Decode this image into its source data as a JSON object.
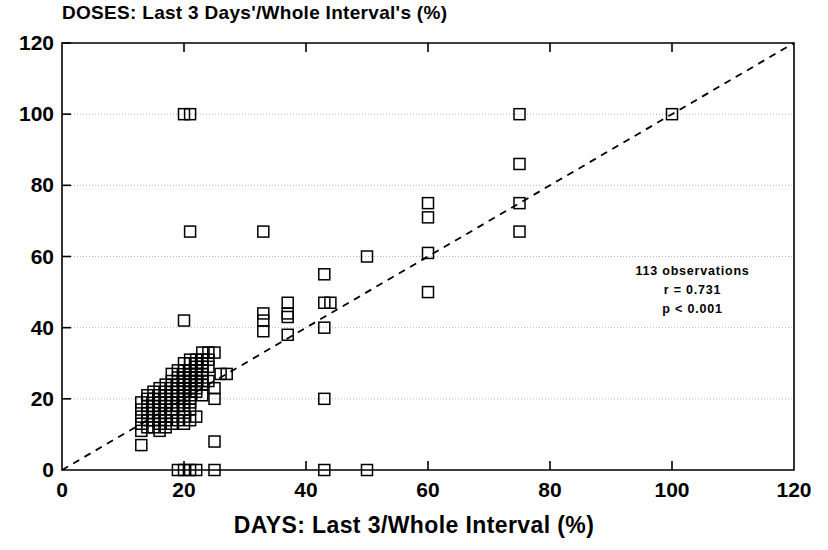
{
  "chart_data": {
    "type": "scatter",
    "title": "DOSES: Last 3 Days'/Whole Interval's (%)",
    "xlabel": "DAYS:  Last 3/Whole Interval (%)",
    "ylabel": "",
    "xlim": [
      0,
      120
    ],
    "ylim": [
      0,
      120
    ],
    "xticks": [
      0,
      20,
      40,
      60,
      80,
      100,
      120
    ],
    "yticks": [
      0,
      20,
      40,
      60,
      80,
      100,
      120
    ],
    "grid": true,
    "grid_style": "dotted-horizontal",
    "marker": "open-square",
    "marker_size_px": 11,
    "reference_line": {
      "label": "identity-line",
      "style": "dashed",
      "from": [
        0,
        0
      ],
      "to": [
        120,
        120
      ]
    },
    "annotations": [
      "113 observations",
      "r = 0.731",
      "p < 0.001"
    ],
    "n_observations": 113,
    "r": 0.731,
    "p": "< 0.001",
    "points": [
      [
        20,
        100
      ],
      [
        21,
        100
      ],
      [
        100,
        100
      ],
      [
        75,
        100
      ],
      [
        75,
        86
      ],
      [
        60,
        75
      ],
      [
        75,
        75
      ],
      [
        60,
        71
      ],
      [
        21,
        67
      ],
      [
        33,
        67
      ],
      [
        75,
        67
      ],
      [
        50,
        60
      ],
      [
        60,
        61
      ],
      [
        60,
        50
      ],
      [
        43,
        55
      ],
      [
        43,
        47
      ],
      [
        44,
        47
      ],
      [
        37,
        47
      ],
      [
        37,
        44
      ],
      [
        33,
        44
      ],
      [
        37,
        43
      ],
      [
        33,
        42
      ],
      [
        20,
        42
      ],
      [
        43,
        40
      ],
      [
        37,
        38
      ],
      [
        33,
        39
      ],
      [
        25,
        33
      ],
      [
        24,
        33
      ],
      [
        23,
        33
      ],
      [
        24,
        31
      ],
      [
        23,
        31
      ],
      [
        22,
        31
      ],
      [
        21,
        31
      ],
      [
        22,
        30
      ],
      [
        23,
        30
      ],
      [
        20,
        30
      ],
      [
        21,
        30
      ],
      [
        22,
        29
      ],
      [
        23,
        29
      ],
      [
        24,
        29
      ],
      [
        21,
        28
      ],
      [
        22,
        28
      ],
      [
        23,
        28
      ],
      [
        19,
        28
      ],
      [
        20,
        28
      ],
      [
        18,
        27
      ],
      [
        21,
        27
      ],
      [
        22,
        27
      ],
      [
        23,
        27
      ],
      [
        27,
        27
      ],
      [
        26,
        27
      ],
      [
        20,
        26
      ],
      [
        21,
        26
      ],
      [
        22,
        26
      ],
      [
        23,
        26
      ],
      [
        19,
        26
      ],
      [
        18,
        25
      ],
      [
        20,
        25
      ],
      [
        21,
        25
      ],
      [
        22,
        25
      ],
      [
        23,
        25
      ],
      [
        24,
        25
      ],
      [
        17,
        24
      ],
      [
        19,
        24
      ],
      [
        20,
        24
      ],
      [
        21,
        24
      ],
      [
        22,
        24
      ],
      [
        23,
        24
      ],
      [
        16,
        23
      ],
      [
        18,
        23
      ],
      [
        20,
        23
      ],
      [
        21,
        23
      ],
      [
        22,
        23
      ],
      [
        25,
        23
      ],
      [
        15,
        22
      ],
      [
        17,
        22
      ],
      [
        19,
        22
      ],
      [
        20,
        22
      ],
      [
        21,
        22
      ],
      [
        22,
        22
      ],
      [
        14,
        21
      ],
      [
        16,
        21
      ],
      [
        18,
        21
      ],
      [
        20,
        21
      ],
      [
        21,
        21
      ],
      [
        23,
        21
      ],
      [
        14,
        20
      ],
      [
        15,
        20
      ],
      [
        17,
        20
      ],
      [
        19,
        20
      ],
      [
        20,
        20
      ],
      [
        21,
        20
      ],
      [
        25,
        20
      ],
      [
        43,
        20
      ],
      [
        13,
        19
      ],
      [
        16,
        19
      ],
      [
        18,
        19
      ],
      [
        20,
        19
      ],
      [
        21,
        19
      ],
      [
        14,
        18
      ],
      [
        15,
        18
      ],
      [
        17,
        18
      ],
      [
        19,
        18
      ],
      [
        20,
        18
      ],
      [
        13,
        17
      ],
      [
        16,
        17
      ],
      [
        18,
        17
      ],
      [
        20,
        17
      ],
      [
        21,
        17
      ],
      [
        14,
        16
      ],
      [
        15,
        16
      ],
      [
        17,
        16
      ],
      [
        13,
        15
      ],
      [
        16,
        15
      ],
      [
        18,
        15
      ],
      [
        20,
        15
      ],
      [
        22,
        15
      ],
      [
        14,
        14
      ],
      [
        15,
        14
      ],
      [
        17,
        14
      ],
      [
        19,
        14
      ],
      [
        21,
        14
      ],
      [
        13,
        13
      ],
      [
        16,
        13
      ],
      [
        18,
        13
      ],
      [
        20,
        13
      ],
      [
        14,
        12
      ],
      [
        15,
        12
      ],
      [
        17,
        12
      ],
      [
        13,
        11
      ],
      [
        16,
        11
      ],
      [
        13,
        7
      ],
      [
        25,
        8
      ],
      [
        19,
        0
      ],
      [
        20,
        0
      ],
      [
        21,
        0
      ],
      [
        22,
        0
      ],
      [
        25,
        0
      ],
      [
        43,
        0
      ],
      [
        50,
        0
      ]
    ]
  },
  "axis": {
    "x_tick_labels": [
      "0",
      "20",
      "40",
      "60",
      "80",
      "100",
      "120"
    ],
    "y_tick_labels": [
      "0",
      "20",
      "40",
      "60",
      "80",
      "100",
      "120"
    ]
  },
  "colors": {
    "ink": "#000000",
    "grid": "#b8b8b8",
    "background": "#ffffff"
  }
}
